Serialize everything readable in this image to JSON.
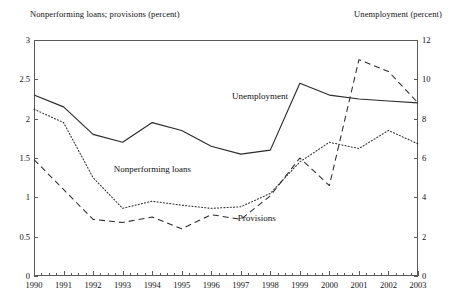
{
  "chart_data": {
    "type": "line",
    "title": "",
    "xlabel": "",
    "ylabel": "Nonperforming loans; provisions (percent)",
    "y2label": "Unemployment (percent)",
    "grid": false,
    "legend_position": "inline-annotations",
    "x": [
      1990,
      1991,
      1992,
      1993,
      1994,
      1995,
      1996,
      1997,
      1998,
      1999,
      2000,
      2001,
      2002,
      2003
    ],
    "categories": [
      "1990",
      "1991",
      "1992",
      "1993",
      "1994",
      "1995",
      "1996",
      "1997",
      "1998",
      "1999",
      "2000",
      "2001",
      "2002",
      "2003"
    ],
    "ylim": [
      0,
      3
    ],
    "yticks": [
      0,
      0.5,
      1,
      1.5,
      2,
      2.5,
      3
    ],
    "ytick_labels": [
      "0",
      "0.5",
      "1",
      "1.5",
      "2",
      "2.5",
      "3"
    ],
    "y2lim": [
      0,
      12
    ],
    "y2ticks": [
      0,
      2,
      4,
      6,
      8,
      10,
      12
    ],
    "y2tick_labels": [
      "0",
      "2",
      "4",
      "6",
      "8",
      "10",
      "12"
    ],
    "minor_ticks_per_year": 4,
    "series": [
      {
        "name": "Unemployment",
        "axis": "right",
        "style": "solid",
        "unit": "percent",
        "values": [
          9.2,
          8.6,
          7.2,
          6.8,
          7.8,
          7.4,
          6.6,
          6.2,
          6.4,
          9.8,
          9.2,
          9.0,
          8.9,
          8.8
        ]
      },
      {
        "name": "Nonperforming loans",
        "axis": "left",
        "style": "dotted",
        "unit": "percent",
        "values": [
          2.12,
          1.95,
          1.25,
          0.86,
          0.95,
          0.9,
          0.86,
          0.88,
          1.05,
          1.45,
          1.7,
          1.62,
          1.85,
          1.68
        ]
      },
      {
        "name": "Provisions",
        "axis": "left",
        "style": "dashed",
        "unit": "percent",
        "values": [
          1.48,
          1.1,
          0.72,
          0.68,
          0.75,
          0.6,
          0.78,
          0.72,
          1.02,
          1.5,
          1.15,
          2.75,
          2.6,
          2.2
        ]
      }
    ],
    "annotations": [
      {
        "text": "Unemployment",
        "x": 1996.7,
        "y_left": 2.28
      },
      {
        "text": "Nonperforming loans",
        "x": 1992.7,
        "y_left": 1.35
      },
      {
        "text": "Provisions",
        "x": 1996.9,
        "y_left": 0.73
      }
    ]
  }
}
